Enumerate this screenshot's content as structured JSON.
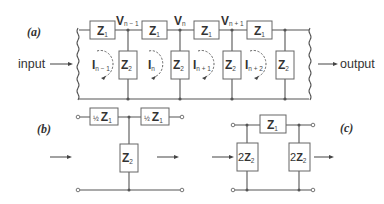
{
  "figure": {
    "panel_a": {
      "label": "(a)",
      "input_label": "input",
      "output_label": "output",
      "series_impedance": {
        "symbol": "Z",
        "subscript": "1"
      },
      "shunt_impedance": {
        "symbol": "Z",
        "subscript": "2"
      },
      "node_voltages": [
        {
          "symbol": "V",
          "subscript": "n − 1"
        },
        {
          "symbol": "V",
          "subscript": "n"
        },
        {
          "symbol": "V",
          "subscript": "n + 1"
        }
      ],
      "loop_currents": [
        {
          "symbol": "I",
          "subscript": "n − 1"
        },
        {
          "symbol": "I",
          "subscript": "n"
        },
        {
          "symbol": "I",
          "subscript": "n + 1"
        },
        {
          "symbol": "I",
          "subscript": "n + 2"
        }
      ]
    },
    "panel_b": {
      "label": "(b)",
      "series_left": {
        "coef": "½",
        "symbol": "Z",
        "subscript": "1"
      },
      "series_right": {
        "coef": "½",
        "symbol": "Z",
        "subscript": "1"
      },
      "shunt": {
        "symbol": "Z",
        "subscript": "2"
      }
    },
    "panel_c": {
      "label": "(c)",
      "series": {
        "symbol": "Z",
        "subscript": "1"
      },
      "shunt_left": {
        "coef": "2",
        "symbol": "Z",
        "subscript": "2"
      },
      "shunt_right": {
        "coef": "2",
        "symbol": "Z",
        "subscript": "2"
      }
    }
  }
}
